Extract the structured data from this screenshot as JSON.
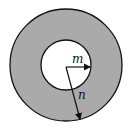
{
  "diagram": {
    "type": "annulus",
    "colors": {
      "ring_fill": "#aaaaaa",
      "inner_fill": "#ffffff",
      "stroke": "#111111"
    },
    "outer_circle": {
      "cx": 66,
      "cy": 65,
      "r": 56
    },
    "inner_circle": {
      "cx": 66,
      "cy": 65,
      "r": 25
    },
    "labels": {
      "inner_radius": "m",
      "outer_radius": "n"
    }
  }
}
